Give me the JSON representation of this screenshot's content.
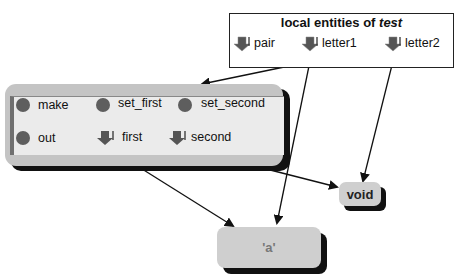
{
  "entities_panel": {
    "title_prefix": "local entities of ",
    "title_name": "test",
    "items": [
      {
        "label": "pair",
        "icon": "variable-icon"
      },
      {
        "label": "letter1",
        "icon": "variable-icon"
      },
      {
        "label": "letter2",
        "icon": "variable-icon"
      }
    ]
  },
  "object": {
    "methods": [
      {
        "label": "make",
        "icon": "method-icon"
      },
      {
        "label": "set_first",
        "icon": "method-icon"
      },
      {
        "label": "set_second",
        "icon": "method-icon"
      },
      {
        "label": "out",
        "icon": "method-icon"
      }
    ],
    "fields": [
      {
        "label": "first",
        "icon": "variable-icon"
      },
      {
        "label": "second",
        "icon": "variable-icon"
      }
    ]
  },
  "void_box": {
    "label": "void"
  },
  "char_box": {
    "label": "'a'"
  },
  "colors": {
    "shadow": "#111111",
    "box": "#cfcfcf",
    "object_outer": "#c4c4c4",
    "object_inner": "#ebebeb",
    "method_dot": "#5e5e5e"
  }
}
